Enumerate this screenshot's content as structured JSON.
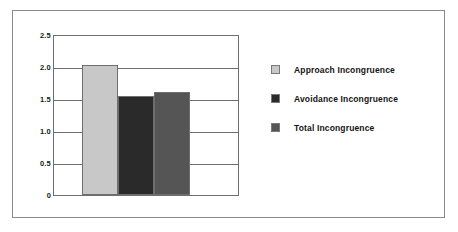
{
  "chart_data": {
    "type": "bar",
    "title": "",
    "xlabel": "",
    "ylabel": "",
    "categories": [
      "Approach Incongruence",
      "Avoidance Incongruence",
      "Total Incongruence"
    ],
    "values": [
      2.05,
      1.56,
      1.62
    ],
    "ylim": [
      0,
      2.5
    ],
    "ytick_labels": [
      "2.5",
      "2.0",
      "1.5",
      "1.0",
      "0.5",
      "0"
    ],
    "ytick_values": [
      2.5,
      2.0,
      1.5,
      1.0,
      0.5,
      0
    ],
    "grid": true,
    "legend_position": "right",
    "series": [
      {
        "name": "Approach Incongruence",
        "value": 2.05,
        "color": "#c8c8c8"
      },
      {
        "name": "Avoidance Incongruence",
        "value": 1.56,
        "color": "#2a2a2a"
      },
      {
        "name": "Total Incongruence",
        "value": 1.62,
        "color": "#555555"
      }
    ]
  },
  "colors": {
    "frame_border": "#8a8a8a",
    "axis": "#6e6e6e",
    "text": "#141414",
    "background": "#ffffff"
  },
  "legend": {
    "items": [
      {
        "label": "Approach Incongruence",
        "color": "#c8c8c8"
      },
      {
        "label": "Avoidance Incongruence",
        "color": "#2a2a2a"
      },
      {
        "label": "Total Incongruence",
        "color": "#555555"
      }
    ]
  }
}
